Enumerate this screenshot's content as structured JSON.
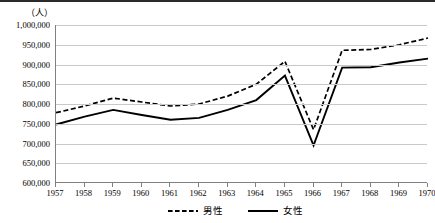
{
  "chart_data": {
    "type": "line",
    "title": "",
    "subtitle": "",
    "xlabel": "",
    "ylabel": "",
    "unit_label": "（人）",
    "categories": [
      "1957",
      "1958",
      "1959",
      "1960",
      "1961",
      "1962",
      "1963",
      "1964",
      "1965",
      "1966",
      "1967",
      "1968",
      "1969",
      "1970"
    ],
    "ylim": [
      600000,
      1000000
    ],
    "ytick_step": 50000,
    "ytick_labels": [
      "1,000,000",
      "950,000",
      "900,000",
      "850,000",
      "800,000",
      "750,000",
      "700,000",
      "650,000",
      "600,000"
    ],
    "ytick_values": [
      1000000,
      950000,
      900000,
      850000,
      800000,
      750000,
      700000,
      650000,
      600000
    ],
    "grid": true,
    "legend_position": "bottom-center",
    "series": [
      {
        "name": "男性",
        "style": "dashed",
        "color": "#000000",
        "values": [
          778000,
          795000,
          815000,
          805000,
          795000,
          800000,
          820000,
          850000,
          908000,
          735000,
          936000,
          938000,
          950000,
          967000
        ]
      },
      {
        "name": "女性",
        "style": "solid",
        "color": "#000000",
        "values": [
          748000,
          768000,
          785000,
          772000,
          760000,
          765000,
          785000,
          810000,
          872000,
          695000,
          892000,
          893000,
          905000,
          915000
        ]
      }
    ]
  },
  "legend": {
    "items": [
      {
        "label": "男性",
        "style": "dashed"
      },
      {
        "label": "女性",
        "style": "solid"
      }
    ]
  }
}
